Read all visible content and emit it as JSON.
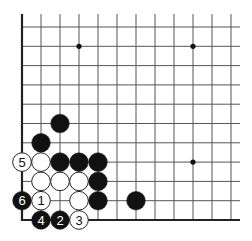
{
  "diagram": {
    "type": "go-board-fragment",
    "corner": "bottom-left",
    "grid": {
      "origin_x": 22,
      "origin_y": 27,
      "spacing_x": 19,
      "spacing_y": 19.3,
      "cols": 12,
      "rows": 11,
      "left_edge": true,
      "bottom_edge": true
    },
    "star_points": [
      {
        "col": 3,
        "row": 1
      },
      {
        "col": 9,
        "row": 1
      },
      {
        "col": 9,
        "row": 7
      }
    ],
    "stones": [
      {
        "col": 2,
        "row": 5,
        "color": "black",
        "label": ""
      },
      {
        "col": 1,
        "row": 6,
        "color": "black",
        "label": ""
      },
      {
        "col": 0,
        "row": 7,
        "color": "white",
        "label": "5"
      },
      {
        "col": 1,
        "row": 7,
        "color": "white",
        "label": ""
      },
      {
        "col": 2,
        "row": 7,
        "color": "black",
        "label": ""
      },
      {
        "col": 3,
        "row": 7,
        "color": "black",
        "label": ""
      },
      {
        "col": 4,
        "row": 7,
        "color": "black",
        "label": ""
      },
      {
        "col": 1,
        "row": 8,
        "color": "white",
        "label": ""
      },
      {
        "col": 2,
        "row": 8,
        "color": "white",
        "label": ""
      },
      {
        "col": 3,
        "row": 8,
        "color": "white",
        "label": ""
      },
      {
        "col": 4,
        "row": 8,
        "color": "black",
        "label": ""
      },
      {
        "col": 0,
        "row": 9,
        "color": "black",
        "label": "6"
      },
      {
        "col": 1,
        "row": 9,
        "color": "white",
        "label": "1"
      },
      {
        "col": 3,
        "row": 9,
        "color": "white",
        "label": ""
      },
      {
        "col": 4,
        "row": 9,
        "color": "black",
        "label": ""
      },
      {
        "col": 6,
        "row": 9,
        "color": "black",
        "label": ""
      },
      {
        "col": 1,
        "row": 10,
        "color": "black",
        "label": "4"
      },
      {
        "col": 2,
        "row": 10,
        "color": "black",
        "label": "2"
      },
      {
        "col": 3,
        "row": 10,
        "color": "white",
        "label": "3"
      }
    ],
    "colors": {
      "line": "#555555",
      "edge": "#222222",
      "black_stone": "#111111",
      "white_stone": "#ffffff",
      "stone_outline": "#222222"
    }
  }
}
